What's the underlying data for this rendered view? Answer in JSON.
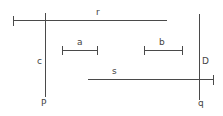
{
  "canvas": {
    "width": 223,
    "height": 116,
    "background": "#ffffff",
    "stroke_color": "#4a4a4a",
    "label_color": "#444444"
  },
  "diagram": {
    "type": "geometric-line-figure",
    "labels": {
      "line_r": "r",
      "line_s": "s",
      "segment_a": "a",
      "segment_b": "b",
      "vertical_left_mid": "c",
      "vertical_left_bottom": "P",
      "vertical_right_mid": "D",
      "vertical_right_bottom": "q"
    },
    "elements": [
      {
        "name": "horizontal-line-r",
        "label": "r",
        "orientation": "horizontal",
        "x1": 13,
        "x2": 167,
        "y": 20,
        "ticks": [
          "start"
        ]
      },
      {
        "name": "vertical-line-c-P",
        "label_mid": "c",
        "label_bottom": "P",
        "orientation": "vertical",
        "x": 45,
        "y1": 13,
        "y2": 97,
        "ticks": []
      },
      {
        "name": "segment-a",
        "label": "a",
        "orientation": "horizontal",
        "x1": 62,
        "x2": 98,
        "y": 50,
        "ticks": [
          "start",
          "end"
        ]
      },
      {
        "name": "segment-b",
        "label": "b",
        "orientation": "horizontal",
        "x1": 144,
        "x2": 183,
        "y": 50,
        "ticks": [
          "start",
          "end"
        ]
      },
      {
        "name": "horizontal-line-s",
        "label": "s",
        "orientation": "horizontal",
        "x1": 88,
        "x2": 214,
        "y": 79,
        "ticks": [
          "end"
        ]
      },
      {
        "name": "vertical-line-D-q",
        "label_mid": "D",
        "label_bottom": "q",
        "orientation": "vertical",
        "x": 199,
        "y1": 14,
        "y2": 100,
        "ticks": []
      }
    ],
    "label_positions": {
      "r": {
        "x": 96,
        "y": 8
      },
      "a": {
        "x": 77,
        "y": 38
      },
      "b": {
        "x": 159,
        "y": 38
      },
      "s": {
        "x": 112,
        "y": 67
      },
      "c": {
        "x": 37,
        "y": 57
      },
      "P": {
        "x": 41,
        "y": 99
      },
      "D": {
        "x": 202,
        "y": 57
      },
      "q": {
        "x": 198,
        "y": 99
      }
    }
  }
}
